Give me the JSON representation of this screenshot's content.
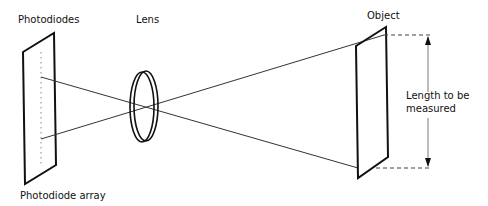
{
  "diagram": {
    "labels": {
      "photodiodes": "Photodiodes",
      "lens": "Lens",
      "object": "Object",
      "length_line1": "Length to be",
      "length_line2": "measured",
      "photodiode_array": "Photodiode array"
    },
    "colors": {
      "stroke": "#111111",
      "ray": "#333333",
      "dashed": "#444444",
      "dotted": "#888888",
      "background": "#ffffff"
    }
  }
}
